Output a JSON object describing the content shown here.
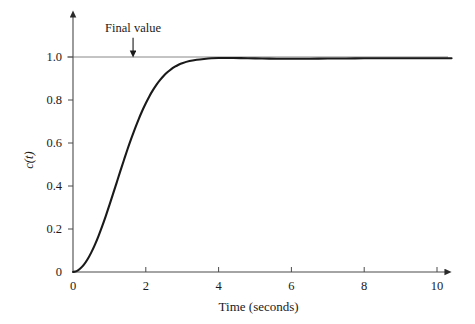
{
  "chart_data": {
    "type": "line",
    "title": "",
    "xlabel": "Time (seconds)",
    "ylabel": "c(t)",
    "xlim": [
      0,
      10.4
    ],
    "ylim": [
      0,
      1.08
    ],
    "grid": false,
    "legend": "none",
    "xticks": [
      0,
      2,
      4,
      6,
      8,
      10
    ],
    "xtick_labels": [
      "0",
      "2",
      "4",
      "6",
      "8",
      "10"
    ],
    "yticks": [
      0,
      0.2,
      0.4,
      0.6,
      0.8,
      1.0
    ],
    "ytick_labels": [
      "0",
      "0.2",
      "0.4",
      "0.6",
      "0.8",
      "1.0"
    ],
    "annotations": [
      {
        "text": "Final value",
        "x": 1.65,
        "y": 1.08,
        "arrow_to_x": 1.65,
        "arrow_to_y": 1.0,
        "style": "down-arrow"
      }
    ],
    "reference_lines": [
      {
        "orientation": "horizontal",
        "y": 1.0,
        "color": "#7a7a7a",
        "label": "Final value"
      }
    ],
    "series": [
      {
        "name": "c(t)",
        "color": "#1a1a1a",
        "width": 2.1,
        "x": [
          0.0,
          0.1,
          0.2,
          0.3,
          0.4,
          0.5,
          0.6,
          0.7,
          0.8,
          0.9,
          1.0,
          1.1,
          1.2,
          1.3,
          1.4,
          1.5,
          1.6,
          1.7,
          1.8,
          1.9,
          2.0,
          2.1,
          2.2,
          2.3,
          2.4,
          2.5,
          2.6,
          2.7,
          2.8,
          2.9,
          3.0,
          3.2,
          3.4,
          3.6,
          3.8,
          4.0,
          4.4,
          4.8,
          5.2,
          5.6,
          6.0,
          6.5,
          7.0,
          7.5,
          8.0,
          8.5,
          9.0,
          9.5,
          10.0,
          10.4
        ],
        "y": [
          0.0,
          0.004,
          0.016,
          0.034,
          0.059,
          0.09,
          0.126,
          0.167,
          0.212,
          0.26,
          0.311,
          0.363,
          0.416,
          0.469,
          0.521,
          0.572,
          0.62,
          0.666,
          0.709,
          0.749,
          0.785,
          0.818,
          0.847,
          0.873,
          0.895,
          0.914,
          0.93,
          0.944,
          0.955,
          0.964,
          0.971,
          0.981,
          0.987,
          0.991,
          0.994,
          0.995,
          0.995,
          0.994,
          0.993,
          0.992,
          0.992,
          0.992,
          0.993,
          0.993,
          0.994,
          0.994,
          0.994,
          0.994,
          0.994,
          0.994
        ]
      }
    ]
  },
  "axes": {
    "x_title": "Time (seconds)",
    "y_title": "c(t)"
  },
  "annotation": {
    "final_value_label": "Final value"
  },
  "colors": {
    "background": "#ffffff",
    "curve": "#1a1a1a",
    "axis": "#4a4a4a",
    "reference_line": "#8a8a8a",
    "text": "#1a1a1a"
  }
}
